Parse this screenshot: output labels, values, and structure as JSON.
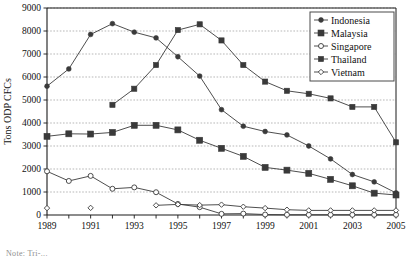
{
  "figure": {
    "footnote": "Note:  Tri-..."
  },
  "axes": {
    "ylabel": "Tons ODP CFCs",
    "xlabel": "",
    "yticks": [
      "0",
      "1000",
      "2000",
      "3000",
      "4000",
      "5000",
      "6000",
      "7000",
      "8000",
      "9000"
    ],
    "xticks": [
      "1989",
      "1991",
      "1993",
      "1995",
      "1997",
      "1999",
      "2001",
      "2003",
      "2005"
    ]
  },
  "legend": {
    "position": "top-right",
    "entries": [
      {
        "label": "Indonesia",
        "marker": "filled-diamond",
        "color": "#2b2b2b"
      },
      {
        "label": "Malaysia",
        "marker": "filled-square",
        "color": "#2b2b2b"
      },
      {
        "label": "Singapore",
        "marker": "open-circle",
        "color": "#2b2b2b"
      },
      {
        "label": "Thailand",
        "marker": "filled-square-small",
        "color": "#2b2b2b"
      },
      {
        "label": "Vietnam",
        "marker": "open-diamond",
        "color": "#2b2b2b"
      }
    ]
  },
  "chart_data": {
    "type": "line",
    "title": "",
    "xlabel": "",
    "ylabel": "Tons ODP CFCs",
    "xlim": [
      1989,
      2005
    ],
    "ylim": [
      0,
      9000
    ],
    "grid": true,
    "legend_position": "top-right",
    "x": [
      1989,
      1990,
      1991,
      1992,
      1993,
      1994,
      1995,
      1996,
      1997,
      1998,
      1999,
      2000,
      2001,
      2002,
      2003,
      2004,
      2005
    ],
    "series": [
      {
        "name": "Indonesia",
        "marker": "filled-diamond",
        "values": [
          5600,
          6350,
          7850,
          8320,
          7950,
          7700,
          6880,
          6040,
          4580,
          3860,
          3630,
          3480,
          3000,
          2440,
          1760,
          1440,
          960
        ]
      },
      {
        "name": "Malaysia",
        "marker": "filled-square",
        "values": [
          3420,
          3530,
          3520,
          3590,
          3900,
          3900,
          3700,
          3250,
          2900,
          2550,
          2070,
          1950,
          1810,
          1550,
          1270,
          950,
          870
        ]
      },
      {
        "name": "Singapore",
        "marker": "open-circle",
        "values": [
          1900,
          1480,
          1700,
          1140,
          1200,
          990,
          480,
          340,
          50,
          60,
          20,
          10,
          10,
          10,
          10,
          10,
          10
        ]
      },
      {
        "name": "Thailand",
        "marker": "filled-square-small",
        "values": [
          null,
          null,
          null,
          4790,
          5490,
          6520,
          8040,
          8290,
          7590,
          6520,
          5800,
          5400,
          5270,
          5070,
          4700,
          4700,
          3160
        ]
      },
      {
        "name": "Vietnam",
        "marker": "open-diamond",
        "values": [
          300,
          null,
          310,
          null,
          null,
          420,
          460,
          430,
          450,
          360,
          300,
          230,
          200,
          200,
          200,
          200,
          200
        ]
      }
    ]
  }
}
